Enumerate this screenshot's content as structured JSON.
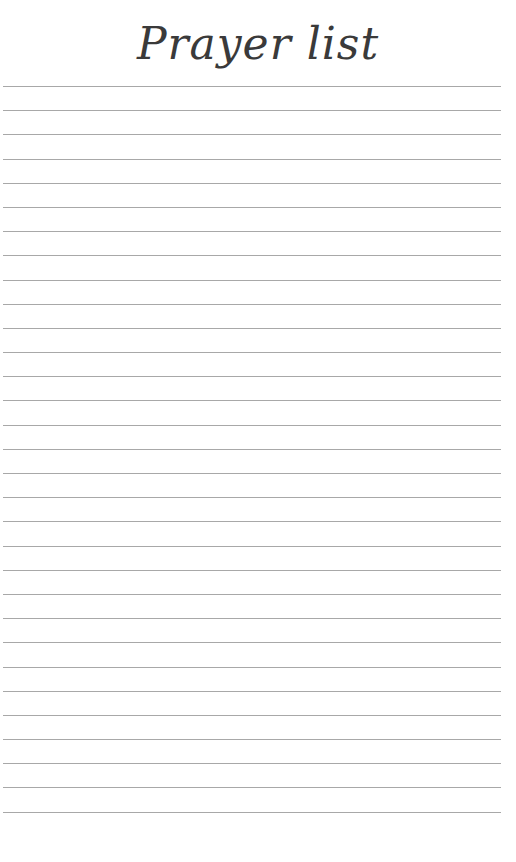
{
  "page": {
    "title": "Prayer list",
    "line_count": 31,
    "line_color": "#a8a8a8"
  }
}
